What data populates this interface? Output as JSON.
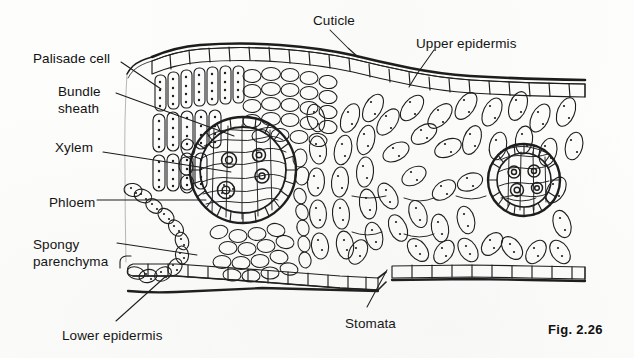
{
  "figure": {
    "caption": "Fig. 2.26",
    "ink_color": "#1a1a1a",
    "background_color": "#fdfdfc"
  },
  "labels": [
    {
      "id": "cuticle",
      "text": "Cuticle",
      "x": 313,
      "y": 12,
      "align": "left",
      "lines": [
        "Cuticle"
      ]
    },
    {
      "id": "upper-epidermis",
      "text": "Upper epidermis",
      "x": 416,
      "y": 35,
      "align": "left",
      "lines": [
        "Upper epidermis"
      ]
    },
    {
      "id": "palisade-cell",
      "text": "Palisade cell",
      "x": 33,
      "y": 50,
      "align": "left",
      "lines": [
        "Palisade cell"
      ]
    },
    {
      "id": "bundle-sheath",
      "text": "Bundle sheath",
      "x": 58,
      "y": 83,
      "align": "left",
      "lines": [
        "Bundle",
        "sheath"
      ]
    },
    {
      "id": "xylem",
      "text": "Xylem",
      "x": 55,
      "y": 139,
      "align": "left",
      "lines": [
        "Xylem"
      ]
    },
    {
      "id": "phloem",
      "text": "Phloem",
      "x": 49,
      "y": 194,
      "align": "left",
      "lines": [
        "Phloem"
      ]
    },
    {
      "id": "spongy-parenchyma",
      "text": "Spongy parenchyma",
      "x": 33,
      "y": 236,
      "align": "left",
      "lines": [
        "Spongy",
        "parenchyma"
      ]
    },
    {
      "id": "lower-epidermis",
      "text": "Lower epidermis",
      "x": 62,
      "y": 327,
      "align": "left",
      "lines": [
        "Lower epidermis"
      ]
    },
    {
      "id": "stomata",
      "text": "Stomata",
      "x": 345,
      "y": 315,
      "align": "left",
      "lines": [
        "Stomata"
      ]
    }
  ],
  "leaders": [
    {
      "id": "leader-cuticle",
      "points": "330,30 348,48 357,56"
    },
    {
      "id": "leader-upper-epidermis",
      "points": "433,52 418,74 410,86"
    },
    {
      "id": "leader-palisade-cell",
      "points": "120,62 160,88"
    },
    {
      "id": "leader-bundle-sheath",
      "points": "115,93 233,136"
    },
    {
      "id": "leader-xylem",
      "points": "102,152 230,172"
    },
    {
      "id": "leader-phloem",
      "points": "96,200 205,200"
    },
    {
      "id": "leader-spongy-parenchyma",
      "points": "116,243 196,255"
    },
    {
      "id": "leader-lower-epidermis",
      "points": "115,321 164,278"
    },
    {
      "id": "leader-stomata",
      "points": "367,308 388,270"
    }
  ],
  "structures": {
    "cuticle": "thin dark wavy line along the upper surface",
    "upper_epidermis": "single row of rectangular cells below the cuticle",
    "palisade_mesophyll": "elongated vertical cells packed with chloroplast dots",
    "spongy_parenchyma": "loose chains of rounded cells with air spaces",
    "vascular_bundles": 2,
    "bundle_sheath": "ring of cells enclosing each vascular bundle",
    "xylem": "large circular vessels inside the bundle",
    "phloem": "small cells below the xylem",
    "lower_epidermis": "single row of cells along the bottom surface",
    "stomata": "pore gap in the lower epidermis"
  }
}
